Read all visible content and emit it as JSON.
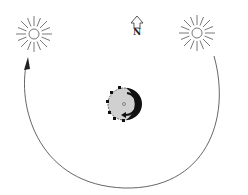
{
  "diagram": {
    "north_label": "N",
    "colors": {
      "line": "#444444",
      "earth_fill": "#cfcfcf",
      "shadow": "#111111",
      "background": "#ffffff"
    },
    "elements": [
      {
        "id": "sun-left",
        "type": "sun",
        "cx": 34,
        "cy": 34
      },
      {
        "id": "sun-right",
        "type": "sun",
        "cx": 197,
        "cy": 33
      },
      {
        "id": "north-arrow",
        "type": "arrow",
        "label": "N"
      },
      {
        "id": "earth",
        "type": "globe",
        "cx": 124,
        "cy": 104
      },
      {
        "id": "orbit-path",
        "type": "arc-arrow"
      }
    ]
  }
}
